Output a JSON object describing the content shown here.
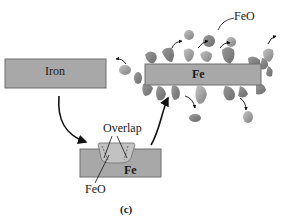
{
  "diagram": {
    "left_block": {
      "label": "Iron"
    },
    "right_block": {
      "label": "Fe"
    },
    "bottom_block": {
      "label": "Fe"
    },
    "oxide_label_top": "FeO",
    "oxide_label_bottom": "FeO",
    "overlap_label": "Overlap",
    "panel_label": "(c)"
  },
  "colors": {
    "block_fill": "#a8a8a8",
    "block_stroke": "#6e6e6e",
    "particle_dark": "#858585",
    "particle_light": "#b5b5b5",
    "arrow": "#111111",
    "background": "#ffffff"
  }
}
